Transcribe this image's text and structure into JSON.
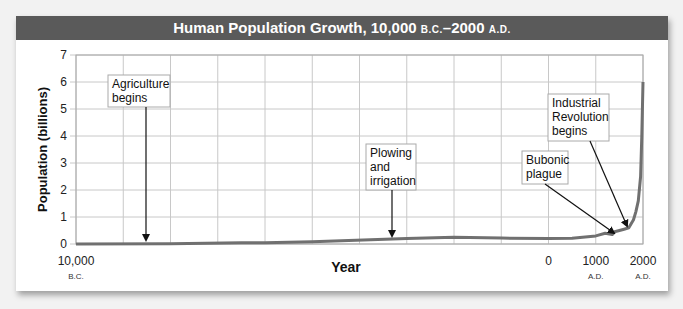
{
  "chart_data": {
    "type": "line",
    "title": "Human Population Growth, 10,000 B.C.–2000 A.D.",
    "title_parts": {
      "main": "Human Population Growth, 10,000 ",
      "bc": "B.C.",
      "dash": "–2000 ",
      "ad": "A.D."
    },
    "xlabel": "Year",
    "ylabel": "Population (billions)",
    "ylim": [
      0,
      7
    ],
    "xlim": [
      -10000,
      2000
    ],
    "yticks": [
      "0",
      "1",
      "2",
      "3",
      "4",
      "5",
      "6",
      "7"
    ],
    "xticks": [
      {
        "value": -10000,
        "label": "10,000",
        "sub": "B.C."
      },
      {
        "value": 0,
        "label": "0",
        "sub": ""
      },
      {
        "value": 1000,
        "label": "1000",
        "sub": "A.D."
      },
      {
        "value": 2000,
        "label": "2000",
        "sub": "A.D."
      }
    ],
    "grid": true,
    "series": [
      {
        "name": "World population",
        "color": "#707070",
        "x": [
          -10000,
          -8000,
          -6500,
          -6000,
          -5000,
          -3000,
          -2000,
          -1000,
          0,
          500,
          1000,
          1200,
          1350,
          1400,
          1500,
          1600,
          1700,
          1800,
          1850,
          1900,
          1950,
          1975,
          2000
        ],
        "y": [
          0.005,
          0.01,
          0.05,
          0.05,
          0.08,
          0.2,
          0.25,
          0.22,
          0.2,
          0.21,
          0.3,
          0.4,
          0.35,
          0.45,
          0.5,
          0.55,
          0.6,
          0.9,
          1.2,
          1.6,
          2.5,
          4.0,
          6.0
        ]
      }
    ],
    "annotations": [
      {
        "text": [
          "Agriculture",
          "begins"
        ],
        "x": -8000,
        "y": 0.05
      },
      {
        "text": [
          "Plowing",
          "and",
          "irrigation"
        ],
        "x": -2000,
        "y": 0.25
      },
      {
        "text": [
          "Bubonic",
          "plague"
        ],
        "x": 1350,
        "y": 0.35
      },
      {
        "text": [
          "Industrial",
          "Revolution",
          "begins"
        ],
        "x": 1750,
        "y": 0.7
      }
    ]
  }
}
